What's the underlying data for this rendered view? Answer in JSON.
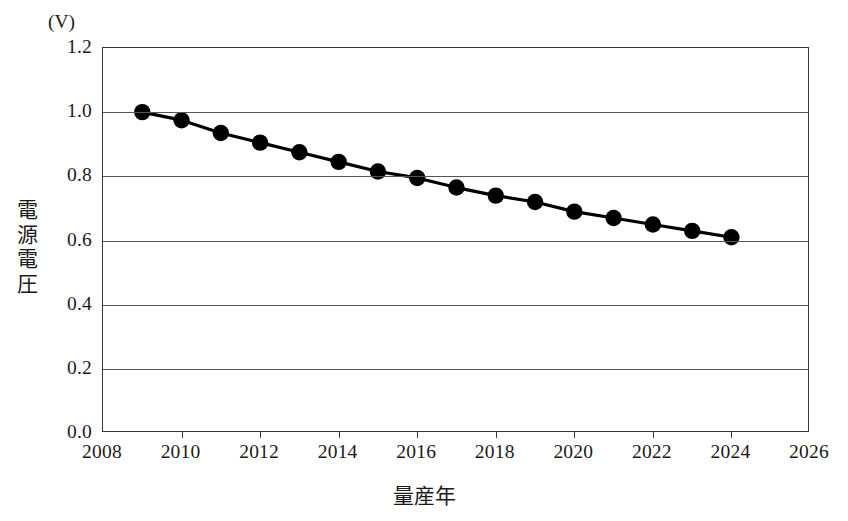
{
  "chart_data": {
    "type": "line",
    "title": "",
    "subtitle": "",
    "xlabel": "量産年",
    "ylabel": "電源電圧",
    "yunit": "(V)",
    "xlim": [
      2008,
      2026
    ],
    "ylim": [
      0.0,
      1.2
    ],
    "grid": "horizontal",
    "legend": "none",
    "xticks": [
      "2008",
      "2010",
      "2012",
      "2014",
      "2016",
      "2018",
      "2020",
      "2022",
      "2024",
      "2026"
    ],
    "xtick_values": [
      2008,
      2010,
      2012,
      2014,
      2016,
      2018,
      2020,
      2022,
      2024,
      2026
    ],
    "yticks": [
      "0.0",
      "0.2",
      "0.4",
      "0.6",
      "0.8",
      "1.0",
      "1.2"
    ],
    "ytick_values": [
      0.0,
      0.2,
      0.4,
      0.6,
      0.8,
      1.0,
      1.2
    ],
    "series": [
      {
        "name": "電源電圧",
        "color": "#000000",
        "marker": "circle",
        "x": [
          2009,
          2010,
          2011,
          2012,
          2013,
          2014,
          2015,
          2016,
          2017,
          2018,
          2019,
          2020,
          2021,
          2022,
          2023,
          2024
        ],
        "values": [
          1.0,
          0.975,
          0.935,
          0.905,
          0.875,
          0.845,
          0.815,
          0.795,
          0.765,
          0.74,
          0.72,
          0.69,
          0.67,
          0.65,
          0.63,
          0.61
        ]
      }
    ]
  },
  "axes": {
    "unit_label": "(V)",
    "y_title": "電源電圧",
    "x_title": "量産年"
  }
}
